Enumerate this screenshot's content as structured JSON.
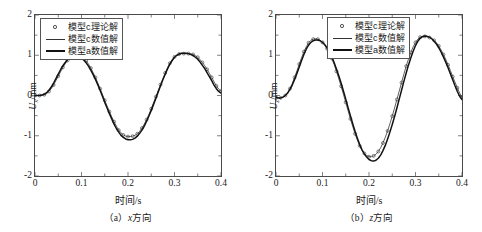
{
  "figure": {
    "panels": [
      {
        "id": "panel-a",
        "caption": "（a）x方向",
        "caption_index": "（a）",
        "caption_axis": "x",
        "caption_suffix": "方向",
        "xlabel": "时间/s",
        "ylabel_symbol": "U",
        "ylabel_sub": "x",
        "ylabel_unit": "/mm",
        "xticks": [
          "0",
          "0.1",
          "0.2",
          "0.3",
          "0.4"
        ],
        "yticks": [
          "2",
          "1",
          "0",
          "-1",
          "-2"
        ]
      },
      {
        "id": "panel-b",
        "caption": "（b）z方向",
        "caption_index": "（b）",
        "caption_axis": "z",
        "caption_suffix": "方向",
        "xlabel": "时间/s",
        "ylabel_symbol": "U",
        "ylabel_sub": "z",
        "ylabel_unit": "/mm",
        "xticks": [
          "0",
          "0.1",
          "0.2",
          "0.3",
          "0.4"
        ],
        "yticks": [
          "2",
          "1",
          "0",
          "-1",
          "-2"
        ]
      }
    ],
    "legend": {
      "entries": [
        {
          "symbol": "circle-marker",
          "label": "模型c理论解"
        },
        {
          "symbol": "thin-line",
          "label": "模型c数值解"
        },
        {
          "symbol": "thick-line",
          "label": "模型a数值解"
        }
      ]
    },
    "colors": {
      "axis": "#4a4a4a",
      "thin_line": "#333333",
      "thick_line": "#111111",
      "marker_stroke": "#333333",
      "background": "#ffffff"
    }
  },
  "chart_data": [
    {
      "type": "line",
      "title": "（a）x方向",
      "xlabel": "时间/s",
      "ylabel": "Ux/mm",
      "xlim": [
        0,
        0.4
      ],
      "ylim": [
        -2,
        2
      ],
      "xticks": [
        0,
        0.1,
        0.2,
        0.3,
        0.4
      ],
      "yticks": [
        -2,
        -1,
        0,
        1,
        2
      ],
      "grid": false,
      "legend_position": "upper-left-inside",
      "x": [
        0,
        0.005,
        0.01,
        0.015,
        0.02,
        0.025,
        0.03,
        0.035,
        0.04,
        0.045,
        0.05,
        0.055,
        0.06,
        0.065,
        0.07,
        0.075,
        0.08,
        0.085,
        0.09,
        0.095,
        0.1,
        0.105,
        0.11,
        0.115,
        0.12,
        0.125,
        0.13,
        0.135,
        0.14,
        0.145,
        0.15,
        0.155,
        0.16,
        0.165,
        0.17,
        0.175,
        0.18,
        0.185,
        0.19,
        0.195,
        0.2,
        0.205,
        0.21,
        0.215,
        0.22,
        0.225,
        0.23,
        0.235,
        0.24,
        0.245,
        0.25,
        0.255,
        0.26,
        0.265,
        0.27,
        0.275,
        0.28,
        0.285,
        0.29,
        0.295,
        0.3,
        0.305,
        0.31,
        0.315,
        0.32,
        0.325,
        0.33,
        0.335,
        0.34,
        0.345,
        0.35,
        0.355,
        0.36,
        0.365,
        0.37,
        0.375,
        0.38,
        0.385,
        0.39,
        0.395,
        0.4
      ],
      "series": [
        {
          "name": "模型c理论解",
          "style": "circle-markers",
          "values": [
            0.0,
            0.0,
            0.0,
            0.01,
            0.02,
            0.05,
            0.1,
            0.17,
            0.26,
            0.37,
            0.48,
            0.59,
            0.7,
            0.79,
            0.87,
            0.93,
            0.97,
            0.99,
            1.0,
            0.99,
            0.96,
            0.92,
            0.86,
            0.78,
            0.68,
            0.57,
            0.45,
            0.31,
            0.17,
            0.03,
            -0.12,
            -0.26,
            -0.4,
            -0.53,
            -0.65,
            -0.76,
            -0.86,
            -0.93,
            -0.98,
            -1.01,
            -1.02,
            -1.02,
            -1.01,
            -0.99,
            -0.95,
            -0.89,
            -0.81,
            -0.71,
            -0.6,
            -0.47,
            -0.33,
            -0.18,
            -0.03,
            0.12,
            0.27,
            0.42,
            0.56,
            0.69,
            0.8,
            0.89,
            0.96,
            1.0,
            1.03,
            1.04,
            1.04,
            1.04,
            1.04,
            1.03,
            1.02,
            0.99,
            0.95,
            0.89,
            0.82,
            0.74,
            0.65,
            0.55,
            0.45,
            0.34,
            0.24,
            0.16,
            0.11
          ]
        },
        {
          "name": "模型c数值解",
          "style": "thin-line",
          "values": [
            0.0,
            0.0,
            0.0,
            0.01,
            0.02,
            0.05,
            0.1,
            0.17,
            0.26,
            0.37,
            0.48,
            0.59,
            0.7,
            0.79,
            0.87,
            0.93,
            0.97,
            0.99,
            1.0,
            0.99,
            0.96,
            0.92,
            0.86,
            0.78,
            0.68,
            0.57,
            0.45,
            0.31,
            0.17,
            0.03,
            -0.12,
            -0.26,
            -0.4,
            -0.53,
            -0.65,
            -0.76,
            -0.86,
            -0.93,
            -0.98,
            -1.01,
            -1.02,
            -1.02,
            -1.01,
            -0.99,
            -0.95,
            -0.89,
            -0.81,
            -0.71,
            -0.6,
            -0.47,
            -0.33,
            -0.18,
            -0.03,
            0.12,
            0.27,
            0.42,
            0.56,
            0.69,
            0.8,
            0.89,
            0.96,
            1.0,
            1.03,
            1.04,
            1.04,
            1.04,
            1.04,
            1.03,
            1.02,
            0.99,
            0.95,
            0.89,
            0.82,
            0.74,
            0.65,
            0.55,
            0.45,
            0.34,
            0.24,
            0.16,
            0.11
          ]
        },
        {
          "name": "模型a数值解",
          "style": "thick-line",
          "values": [
            0.0,
            0.0,
            0.0,
            0.01,
            0.03,
            0.07,
            0.13,
            0.21,
            0.31,
            0.42,
            0.53,
            0.64,
            0.74,
            0.82,
            0.89,
            0.94,
            0.97,
            0.98,
            0.98,
            0.96,
            0.93,
            0.88,
            0.81,
            0.73,
            0.63,
            0.52,
            0.4,
            0.27,
            0.13,
            -0.02,
            -0.17,
            -0.31,
            -0.45,
            -0.58,
            -0.71,
            -0.82,
            -0.91,
            -0.99,
            -1.04,
            -1.08,
            -1.1,
            -1.1,
            -1.09,
            -1.06,
            -1.01,
            -0.94,
            -0.86,
            -0.76,
            -0.64,
            -0.51,
            -0.37,
            -0.22,
            -0.07,
            0.09,
            0.24,
            0.39,
            0.53,
            0.66,
            0.78,
            0.87,
            0.95,
            1.0,
            1.03,
            1.05,
            1.05,
            1.05,
            1.04,
            1.02,
            0.99,
            0.95,
            0.9,
            0.83,
            0.75,
            0.67,
            0.57,
            0.47,
            0.37,
            0.26,
            0.17,
            0.1,
            0.06
          ]
        }
      ]
    },
    {
      "type": "line",
      "title": "（b）z方向",
      "xlabel": "时间/s",
      "ylabel": "Uz/mm",
      "xlim": [
        0,
        0.4
      ],
      "ylim": [
        -2,
        2
      ],
      "xticks": [
        0,
        0.1,
        0.2,
        0.3,
        0.4
      ],
      "yticks": [
        -2,
        -1,
        0,
        1,
        2
      ],
      "grid": false,
      "legend_position": "upper-center-inside",
      "x": [
        0,
        0.005,
        0.01,
        0.015,
        0.02,
        0.025,
        0.03,
        0.035,
        0.04,
        0.045,
        0.05,
        0.055,
        0.06,
        0.065,
        0.07,
        0.075,
        0.08,
        0.085,
        0.09,
        0.095,
        0.1,
        0.105,
        0.11,
        0.115,
        0.12,
        0.125,
        0.13,
        0.135,
        0.14,
        0.145,
        0.15,
        0.155,
        0.16,
        0.165,
        0.17,
        0.175,
        0.18,
        0.185,
        0.19,
        0.195,
        0.2,
        0.205,
        0.21,
        0.215,
        0.22,
        0.225,
        0.23,
        0.235,
        0.24,
        0.245,
        0.25,
        0.255,
        0.26,
        0.265,
        0.27,
        0.275,
        0.28,
        0.285,
        0.29,
        0.295,
        0.3,
        0.305,
        0.31,
        0.315,
        0.32,
        0.325,
        0.33,
        0.335,
        0.34,
        0.345,
        0.35,
        0.355,
        0.36,
        0.365,
        0.37,
        0.375,
        0.38,
        0.385,
        0.39,
        0.395,
        0.4
      ],
      "series": [
        {
          "name": "模型c理论解",
          "style": "circle-markers",
          "values": [
            -0.05,
            -0.06,
            -0.06,
            -0.04,
            0.0,
            0.07,
            0.17,
            0.3,
            0.45,
            0.61,
            0.78,
            0.94,
            1.09,
            1.21,
            1.31,
            1.37,
            1.4,
            1.41,
            1.4,
            1.37,
            1.32,
            1.25,
            1.16,
            1.05,
            0.92,
            0.77,
            0.6,
            0.42,
            0.23,
            0.03,
            -0.17,
            -0.38,
            -0.58,
            -0.77,
            -0.95,
            -1.11,
            -1.25,
            -1.36,
            -1.44,
            -1.49,
            -1.52,
            -1.52,
            -1.5,
            -1.46,
            -1.39,
            -1.3,
            -1.18,
            -1.04,
            -0.88,
            -0.7,
            -0.51,
            -0.31,
            -0.1,
            0.11,
            0.32,
            0.53,
            0.73,
            0.91,
            1.07,
            1.21,
            1.32,
            1.4,
            1.45,
            1.47,
            1.47,
            1.46,
            1.44,
            1.41,
            1.37,
            1.31,
            1.23,
            1.13,
            1.02,
            0.9,
            0.76,
            0.62,
            0.47,
            0.33,
            0.19,
            0.06,
            -0.05
          ]
        },
        {
          "name": "模型c数值解",
          "style": "thin-line",
          "values": [
            -0.05,
            -0.06,
            -0.06,
            -0.04,
            0.0,
            0.07,
            0.17,
            0.3,
            0.45,
            0.61,
            0.78,
            0.94,
            1.09,
            1.21,
            1.31,
            1.37,
            1.4,
            1.41,
            1.4,
            1.37,
            1.32,
            1.25,
            1.16,
            1.05,
            0.92,
            0.77,
            0.6,
            0.42,
            0.23,
            0.03,
            -0.17,
            -0.38,
            -0.58,
            -0.77,
            -0.95,
            -1.11,
            -1.25,
            -1.36,
            -1.44,
            -1.49,
            -1.52,
            -1.52,
            -1.5,
            -1.46,
            -1.39,
            -1.3,
            -1.18,
            -1.04,
            -0.88,
            -0.7,
            -0.51,
            -0.31,
            -0.1,
            0.11,
            0.32,
            0.53,
            0.73,
            0.91,
            1.07,
            1.21,
            1.32,
            1.4,
            1.45,
            1.47,
            1.47,
            1.46,
            1.44,
            1.41,
            1.37,
            1.31,
            1.23,
            1.13,
            1.02,
            0.9,
            0.76,
            0.62,
            0.47,
            0.33,
            0.19,
            0.06,
            -0.05
          ]
        },
        {
          "name": "模型a数值解",
          "style": "thick-line",
          "values": [
            -0.05,
            -0.06,
            -0.06,
            -0.04,
            0.0,
            0.06,
            0.15,
            0.26,
            0.4,
            0.55,
            0.71,
            0.87,
            1.02,
            1.15,
            1.25,
            1.32,
            1.36,
            1.38,
            1.38,
            1.36,
            1.32,
            1.26,
            1.18,
            1.08,
            0.96,
            0.82,
            0.66,
            0.49,
            0.31,
            0.11,
            -0.09,
            -0.3,
            -0.5,
            -0.7,
            -0.89,
            -1.06,
            -1.22,
            -1.35,
            -1.45,
            -1.53,
            -1.59,
            -1.62,
            -1.63,
            -1.61,
            -1.56,
            -1.48,
            -1.37,
            -1.24,
            -1.08,
            -0.91,
            -0.72,
            -0.52,
            -0.31,
            -0.09,
            0.13,
            0.35,
            0.56,
            0.76,
            0.94,
            1.1,
            1.24,
            1.35,
            1.42,
            1.46,
            1.48,
            1.47,
            1.45,
            1.41,
            1.35,
            1.28,
            1.19,
            1.08,
            0.96,
            0.83,
            0.69,
            0.54,
            0.39,
            0.24,
            0.1,
            -0.02,
            -0.1
          ]
        }
      ]
    }
  ]
}
